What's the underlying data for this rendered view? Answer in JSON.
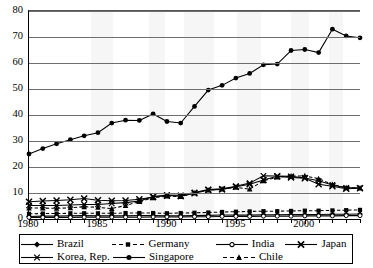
{
  "chart_data": {
    "type": "line",
    "title": "",
    "xlabel": "",
    "ylabel": "",
    "xlim": [
      1980,
      2004
    ],
    "ylim": [
      0,
      80
    ],
    "ytick_step": 10,
    "grid": true,
    "legend_position": "bottom",
    "x": [
      1980,
      1981,
      1982,
      1983,
      1984,
      1985,
      1986,
      1987,
      1988,
      1989,
      1990,
      1991,
      1992,
      1993,
      1994,
      1995,
      1996,
      1997,
      1998,
      1999,
      2000,
      2001,
      2002,
      2003,
      2004
    ],
    "xtick_labels": [
      "1980",
      "1985",
      "1990",
      "1995",
      "2000"
    ],
    "xtick_values": [
      1980,
      1985,
      1990,
      1995,
      2000
    ],
    "ytick_labels": [
      "0",
      "10",
      "20",
      "30",
      "40",
      "50",
      "60",
      "70",
      "80"
    ],
    "ytick_values": [
      0,
      10,
      20,
      30,
      40,
      50,
      60,
      70,
      80
    ],
    "series": [
      {
        "name": "Brazil",
        "marker": "diamond",
        "dash": "solid",
        "color": "#000000",
        "values": [
          1.0,
          1.1,
          1.1,
          1.2,
          1.3,
          1.2,
          1.2,
          1.2,
          1.3,
          1.3,
          1.2,
          1.2,
          1.3,
          1.4,
          1.5,
          1.5,
          1.5,
          1.6,
          1.6,
          1.7,
          1.7,
          1.7,
          1.8,
          1.8,
          1.9
        ]
      },
      {
        "name": "Germany",
        "marker": "square",
        "dash": "dashed",
        "color": "#000000",
        "values": [
          2.0,
          2.1,
          2.1,
          2.2,
          2.2,
          2.2,
          2.2,
          2.3,
          2.3,
          2.3,
          2.2,
          2.3,
          2.4,
          2.5,
          2.7,
          2.8,
          2.9,
          3.0,
          3.0,
          3.1,
          3.2,
          3.2,
          3.3,
          3.4,
          3.5
        ]
      },
      {
        "name": "India",
        "marker": "circle-open",
        "dash": "solid",
        "color": "#000000",
        "values": [
          0.6,
          0.6,
          0.6,
          0.6,
          0.7,
          0.7,
          0.7,
          0.7,
          0.7,
          0.8,
          0.8,
          0.8,
          0.9,
          0.9,
          1.0,
          1.0,
          1.0,
          1.1,
          1.1,
          1.1,
          1.2,
          1.2,
          1.2,
          1.3,
          1.3
        ]
      },
      {
        "name": "Japan",
        "marker": "x",
        "dash": "solid",
        "color": "#000000",
        "values": [
          6.6,
          6.9,
          7.1,
          7.4,
          7.9,
          7.2,
          7.0,
          7.1,
          7.6,
          8.5,
          9.0,
          8.8,
          9.9,
          11.2,
          11.4,
          12.4,
          13.4,
          15.0,
          16.4,
          16.0,
          15.7,
          13.4,
          12.6,
          11.6,
          11.8
        ]
      },
      {
        "name": "Korea, Rep.",
        "marker": "x-thin",
        "dash": "solid",
        "color": "#000000",
        "values": [
          5.2,
          5.2,
          5.2,
          5.4,
          5.6,
          5.6,
          6.0,
          6.3,
          6.9,
          8.6,
          9.2,
          9.1,
          10.2,
          11.3,
          11.6,
          12.6,
          13.8,
          16.6,
          16.5,
          16.4,
          15.8,
          14.7,
          13.1,
          12.0,
          12.0
        ]
      },
      {
        "name": "Singapore",
        "marker": "circle-filled",
        "dash": "solid",
        "color": "#000000",
        "values": [
          25.0,
          27.1,
          28.9,
          30.5,
          32.0,
          33.2,
          36.9,
          38.0,
          37.9,
          40.4,
          37.5,
          36.9,
          43.3,
          49.6,
          51.4,
          54.2,
          56.0,
          59.3,
          59.6,
          64.8,
          65.2,
          64.0,
          73.0,
          70.4,
          69.7
        ]
      },
      {
        "name": "Chile",
        "marker": "triangle",
        "dash": "dashed",
        "color": "#000000",
        "values": [
          4.2,
          4.2,
          4.1,
          4.3,
          4.7,
          4.5,
          4.0,
          5.2,
          6.7,
          8.1,
          8.8,
          8.6,
          10.0,
          11.1,
          11.5,
          12.2,
          11.5,
          14.7,
          16.1,
          16.5,
          16.6,
          15.5,
          13.3,
          12.0,
          11.9
        ]
      }
    ]
  },
  "legend": {
    "items": [
      {
        "label": "Brazil",
        "marker": "diamond",
        "dash": "solid"
      },
      {
        "label": "Germany",
        "marker": "square",
        "dash": "dashed"
      },
      {
        "label": "India",
        "marker": "circle-open",
        "dash": "solid"
      },
      {
        "label": "Japan",
        "marker": "x",
        "dash": "solid"
      },
      {
        "label": "Korea, Rep.",
        "marker": "x-thin",
        "dash": "solid"
      },
      {
        "label": "Singapore",
        "marker": "circle-filled",
        "dash": "solid"
      },
      {
        "label": "Chile",
        "marker": "triangle",
        "dash": "dashed"
      }
    ]
  },
  "style": {
    "line_color": "#000000",
    "grid_color": "#6e6e6e",
    "axis_color": "#000000",
    "background": "#ffffff"
  }
}
